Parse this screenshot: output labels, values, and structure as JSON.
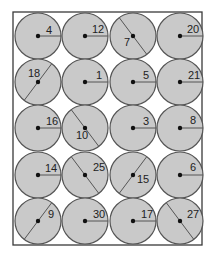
{
  "frame": {
    "x": 13,
    "y": 12,
    "width": 189,
    "height": 233,
    "stroke": "#3a3a3a"
  },
  "colors": {
    "disc_fill": "#c9c9c9",
    "disc_stroke": "#555555",
    "dot": "#111111"
  },
  "radius": 23,
  "circles": [
    {
      "label": "4",
      "cx": 38,
      "cy": 36,
      "line": "radius-right",
      "tx": 46,
      "ty": 34
    },
    {
      "label": "12",
      "cx": 85,
      "cy": 36,
      "line": "radius-right",
      "tx": 92,
      "ty": 33
    },
    {
      "label": "7",
      "cx": 133,
      "cy": 36,
      "line": "diameter-diag",
      "tx": 124,
      "ty": 46
    },
    {
      "label": "20",
      "cx": 180,
      "cy": 36,
      "line": "radius-right",
      "tx": 187,
      "ty": 33
    },
    {
      "label": "18",
      "cx": 38,
      "cy": 82,
      "line": "diameter-diag2",
      "tx": 28,
      "ty": 77
    },
    {
      "label": "1",
      "cx": 85,
      "cy": 82,
      "line": "radius-right",
      "tx": 96,
      "ty": 79
    },
    {
      "label": "5",
      "cx": 133,
      "cy": 82,
      "line": "radius-right",
      "tx": 143,
      "ty": 79
    },
    {
      "label": "21",
      "cx": 180,
      "cy": 82,
      "line": "radius-right",
      "tx": 188,
      "ty": 79
    },
    {
      "label": "16",
      "cx": 38,
      "cy": 128,
      "line": "radius-right",
      "tx": 46,
      "ty": 125
    },
    {
      "label": "10",
      "cx": 85,
      "cy": 128,
      "line": "diameter-diag",
      "tx": 76,
      "ty": 139
    },
    {
      "label": "3",
      "cx": 133,
      "cy": 128,
      "line": "radius-right",
      "tx": 143,
      "ty": 125
    },
    {
      "label": "8",
      "cx": 180,
      "cy": 128,
      "line": "radius-right",
      "tx": 190,
      "ty": 124
    },
    {
      "label": "14",
      "cx": 38,
      "cy": 175,
      "line": "radius-right",
      "tx": 45,
      "ty": 172
    },
    {
      "label": "25",
      "cx": 85,
      "cy": 175,
      "line": "diameter-diag",
      "tx": 93,
      "ty": 171
    },
    {
      "label": "15",
      "cx": 133,
      "cy": 175,
      "line": "diameter-diag2",
      "tx": 137,
      "ty": 183
    },
    {
      "label": "6",
      "cx": 180,
      "cy": 175,
      "line": "radius-right",
      "tx": 190,
      "ty": 171
    },
    {
      "label": "9",
      "cx": 38,
      "cy": 221,
      "line": "diameter-diag2",
      "tx": 48,
      "ty": 218
    },
    {
      "label": "30",
      "cx": 85,
      "cy": 221,
      "line": "radius-right",
      "tx": 93,
      "ty": 218
    },
    {
      "label": "17",
      "cx": 133,
      "cy": 221,
      "line": "radius-right",
      "tx": 141,
      "ty": 218
    },
    {
      "label": "27",
      "cx": 180,
      "cy": 221,
      "line": "diameter-diag",
      "tx": 187,
      "ty": 218
    }
  ]
}
